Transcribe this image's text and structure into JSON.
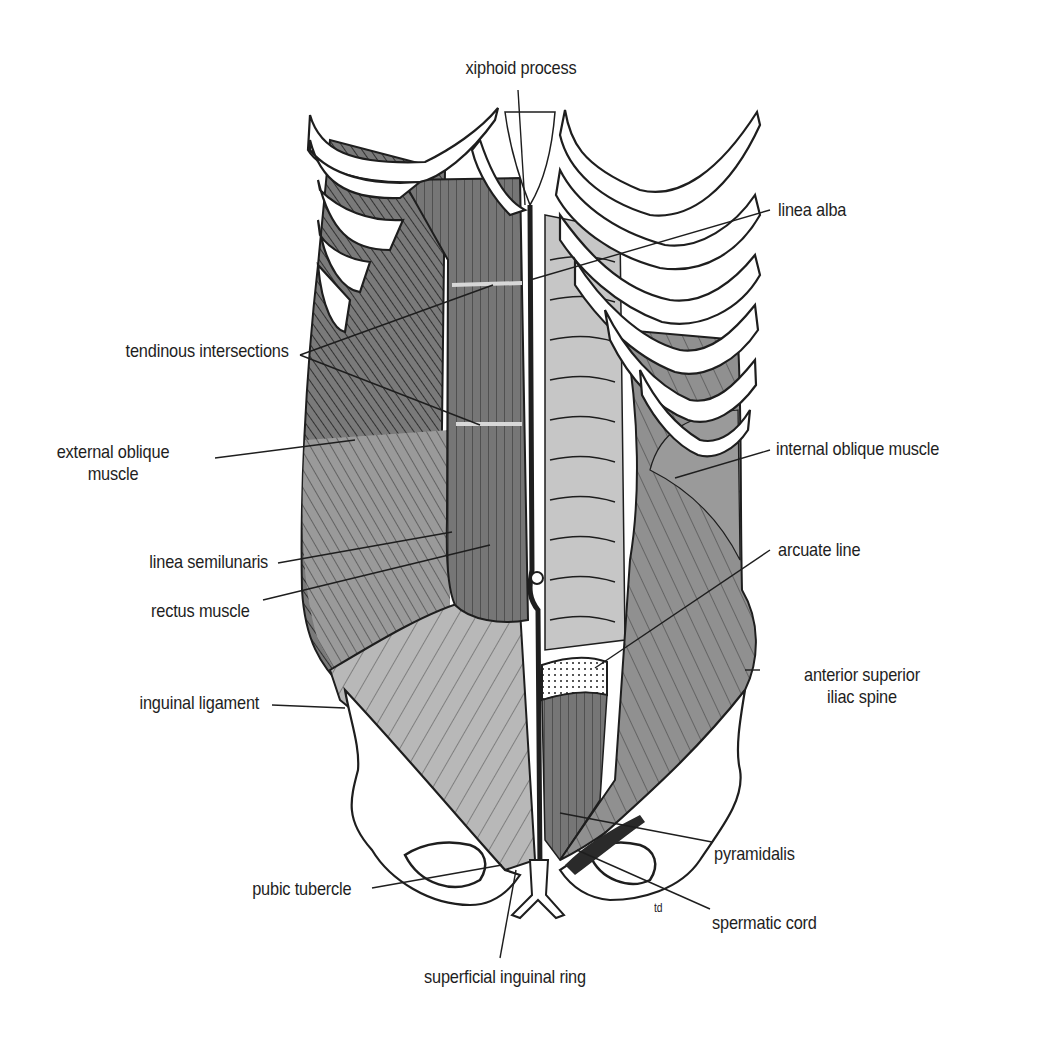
{
  "figure": {
    "colors": {
      "background": "#ffffff",
      "ink": "#1e1e1e",
      "muscle_dark": "#6e6e6e",
      "muscle_mid": "#8e8e8e",
      "muscle_light": "#b4b4b4",
      "sheath_light": "#c8c8c8",
      "bone": "#ffffff"
    },
    "signature": "td"
  },
  "labels": {
    "xiphoid_process": "xiphoid process",
    "linea_alba": "linea alba",
    "tendinous_intersections": "tendinous intersections",
    "external_oblique_l1": "external oblique",
    "external_oblique_l2": "muscle",
    "internal_oblique": "internal oblique muscle",
    "linea_semilunaris": "linea semilunaris",
    "arcuate_line": "arcuate line",
    "rectus_muscle": "rectus muscle",
    "asis_l1": "anterior superior",
    "asis_l2": "iliac spine",
    "inguinal_ligament": "inguinal ligament",
    "pyramidalis": "pyramidalis",
    "pubic_tubercle": "pubic tubercle",
    "spermatic_cord": "spermatic cord",
    "superficial_inguinal_ring": "superficial inguinal ring"
  }
}
